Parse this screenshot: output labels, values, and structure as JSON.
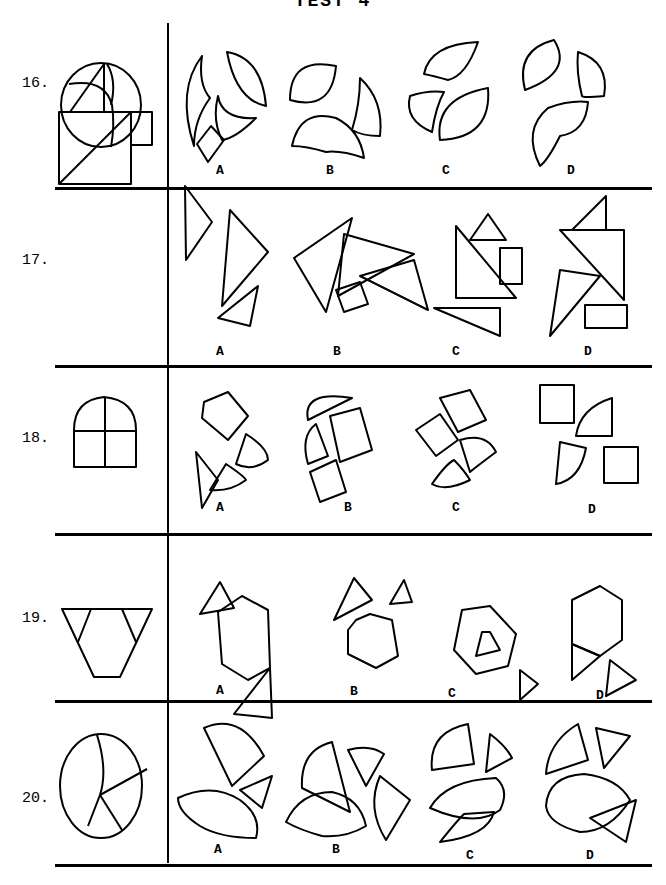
{
  "page": {
    "header": "TEST 4",
    "questions": [
      {
        "number": "16.",
        "shape": "circle-three-arcs",
        "options": [
          "A",
          "B",
          "C",
          "D"
        ]
      },
      {
        "number": "17.",
        "shape": "square-triangle-rectangle",
        "options": [
          "A",
          "B",
          "C",
          "D"
        ]
      },
      {
        "number": "18.",
        "shape": "arched-window",
        "options": [
          "A",
          "B",
          "C",
          "D"
        ]
      },
      {
        "number": "19.",
        "shape": "hexagon-two-triangles",
        "options": [
          "A",
          "B",
          "C",
          "D"
        ]
      },
      {
        "number": "20.",
        "shape": "ellipse-four-segments",
        "options": [
          "A",
          "B",
          "C",
          "D"
        ]
      }
    ]
  }
}
